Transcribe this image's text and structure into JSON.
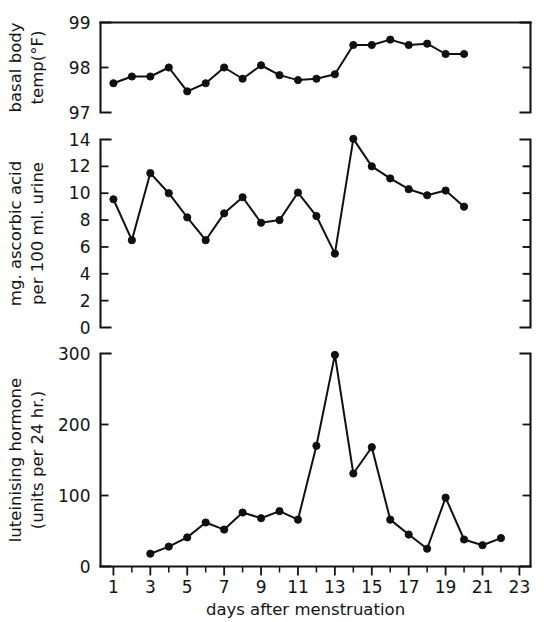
{
  "figure": {
    "background": "#ffffff",
    "ink_color": "#141414",
    "xlabel": "days after menstruation",
    "x_tick_labels": [
      "1",
      "3",
      "5",
      "7",
      "9",
      "11",
      "13",
      "15",
      "17",
      "19",
      "21",
      "23"
    ],
    "x_tick_values": [
      1,
      3,
      5,
      7,
      9,
      11,
      13,
      15,
      17,
      19,
      21,
      23
    ],
    "xlim": [
      0.3,
      23.6
    ]
  },
  "chart_data": [
    {
      "type": "line",
      "panel": "top",
      "title": "",
      "ylabel": "basal body temp(°F)",
      "ylabel_lines": [
        "basal body",
        "temp(°F)"
      ],
      "xlabel": "days after menstruation",
      "ylim": [
        97,
        99
      ],
      "y_ticks": [
        97,
        98,
        99
      ],
      "y_tick_labels": [
        "97",
        "98",
        "99"
      ],
      "grid": false,
      "legend": "none",
      "x": [
        1,
        2,
        3,
        4,
        5,
        6,
        7,
        8,
        9,
        10,
        11,
        12,
        13,
        14,
        15,
        16,
        17,
        18,
        19,
        20
      ],
      "values": [
        97.65,
        97.8,
        97.8,
        98.0,
        97.47,
        97.65,
        98.0,
        97.75,
        98.05,
        97.83,
        97.72,
        97.75,
        97.85,
        98.5,
        98.5,
        98.62,
        98.5,
        98.53,
        98.3,
        98.3
      ]
    },
    {
      "type": "line",
      "panel": "middle",
      "title": "",
      "ylabel": "mg. ascorbic acid per 100 ml. urine",
      "ylabel_lines": [
        "mg. ascorbic acid",
        "per 100 ml. urine"
      ],
      "xlabel": "days after menstruation",
      "ylim": [
        0,
        14
      ],
      "y_ticks": [
        0,
        2,
        4,
        6,
        8,
        10,
        12,
        14
      ],
      "y_tick_labels": [
        "0",
        "2",
        "4",
        "6",
        "8",
        "10",
        "12",
        "14"
      ],
      "grid": false,
      "legend": "none",
      "x": [
        1,
        2,
        3,
        4,
        5,
        6,
        7,
        8,
        9,
        10,
        11,
        12,
        13,
        14,
        15,
        16,
        17,
        18,
        19,
        20
      ],
      "values": [
        9.55,
        6.5,
        11.5,
        10.0,
        8.2,
        6.5,
        8.5,
        9.7,
        7.8,
        8.0,
        10.05,
        8.3,
        5.5,
        14.05,
        12.0,
        11.1,
        10.3,
        9.85,
        10.2,
        9.0
      ]
    },
    {
      "type": "line",
      "panel": "bottom",
      "title": "",
      "ylabel": "luteinising hormone (units per 24 hr.)",
      "ylabel_lines": [
        "luteinising hormone",
        "(units per 24 hr.)"
      ],
      "xlabel": "days after menstruation",
      "ylim": [
        0,
        300
      ],
      "y_ticks": [
        0,
        100,
        200,
        300
      ],
      "y_tick_labels": [
        "0",
        "100",
        "200",
        "300"
      ],
      "grid": false,
      "legend": "none",
      "x": [
        3,
        4,
        5,
        6,
        7,
        8,
        9,
        10,
        11,
        12,
        13,
        14,
        15,
        16,
        17,
        18,
        19,
        20,
        21,
        22
      ],
      "values": [
        18,
        28,
        41,
        62,
        52,
        76,
        68,
        78,
        66,
        170,
        298,
        131,
        168,
        66,
        45,
        25,
        97,
        38,
        30,
        40
      ]
    }
  ]
}
